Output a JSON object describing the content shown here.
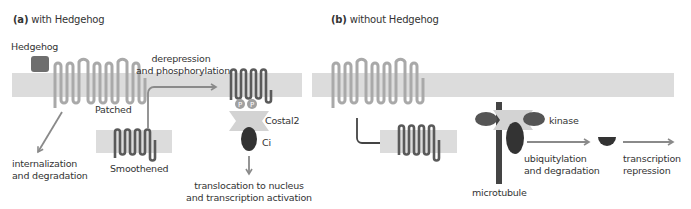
{
  "panels": [
    {
      "id": "a",
      "letter": "(a)",
      "title": "with Hedgehog",
      "labels": {
        "hedgehog": "Hedgehog",
        "patched": "Patched",
        "smoothened": "Smoothened",
        "derepression": "derepression\nand phosphorylation",
        "costal2": "Costal2",
        "ci": "Ci",
        "phospho_mark": "P",
        "internalization": "internalization\nand degradation",
        "translocation": "translocation to nucleus\nand transcription activation"
      }
    },
    {
      "id": "b",
      "letter": "(b)",
      "title": "without Hedgehog",
      "labels": {
        "kinase": "kinase",
        "microtubule": "microtubule",
        "ubiquitylation": "ubiquitylation\nand degradation",
        "repression": "transcription\nrepression"
      }
    }
  ],
  "colors": {
    "membrane": "#dcdcdc",
    "patched": "#a9a9a9",
    "hedgehog": "#6e6e6e",
    "smoothened": "#5a5a5a",
    "costal2": "#d3d3d3",
    "ci": "#333333",
    "kinase": "#555555",
    "arrow": "#8a8a8a",
    "inhibit": "#444444",
    "text": "#333333"
  }
}
